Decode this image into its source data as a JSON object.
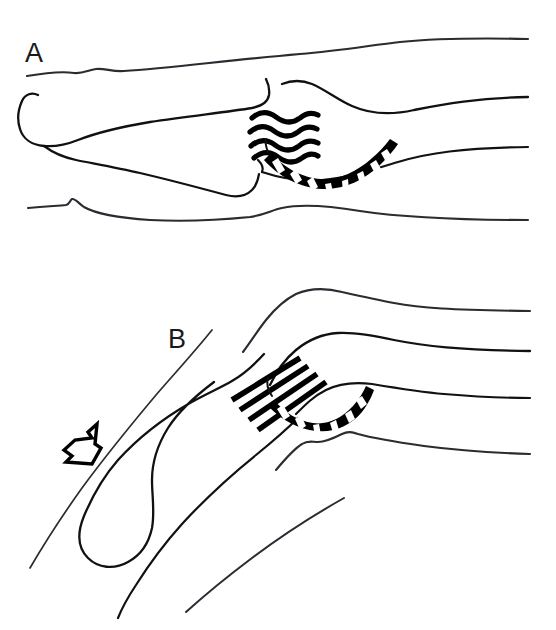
{
  "figure": {
    "type": "medical-line-drawing",
    "background_color": "#ffffff",
    "ink_color": "#000000",
    "width": 556,
    "height": 630
  },
  "panels": [
    {
      "id": "A",
      "label": "A",
      "label_x": 25,
      "label_y": 62,
      "state": "relaxed",
      "ligament_fiber_style": "wavy",
      "ligament_fiber_count": 4,
      "capsule_style": "striped-crescent",
      "capsule_stripe_count": 9,
      "has_stress_arrow": false
    },
    {
      "id": "B",
      "label": "B",
      "label_x": 168,
      "label_y": 348,
      "state": "stressed",
      "ligament_fiber_style": "straight-taut",
      "ligament_fiber_count": 4,
      "capsule_style": "striped-crescent",
      "capsule_stripe_count": 7,
      "has_stress_arrow": true,
      "arrow_direction": "down-left",
      "arrow_meaning": "applied stress force"
    }
  ],
  "caption": {
    "text": "",
    "visible": false
  }
}
